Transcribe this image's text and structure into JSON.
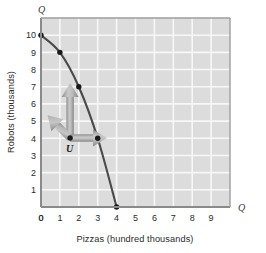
{
  "chart_data": {
    "type": "line",
    "title": "",
    "xlabel": "Pizzas (hundred thousands)",
    "ylabel": "Robots (thousands)",
    "x_axis_symbol": "Q",
    "y_axis_symbol": "Q",
    "xlim": [
      0,
      10
    ],
    "ylim": [
      0,
      11
    ],
    "xticks": [
      0,
      1,
      2,
      3,
      4,
      5,
      6,
      7,
      8,
      9
    ],
    "yticks": [
      0,
      1,
      2,
      3,
      4,
      5,
      6,
      7,
      8,
      9,
      10
    ],
    "xtick_labels": [
      "0",
      "1",
      "2",
      "3",
      "4",
      "5",
      "6",
      "7",
      "8",
      "9"
    ],
    "ytick_labels": [
      "0",
      "1",
      "2",
      "3",
      "4",
      "5",
      "6",
      "7",
      "8",
      "9",
      "10"
    ],
    "grid": true,
    "legend": "none",
    "series": [
      {
        "name": "Production possibilities frontier",
        "type": "line",
        "color": "#4a4a4a",
        "x": [
          0,
          1,
          2,
          3,
          4
        ],
        "values": [
          10,
          9,
          7,
          4,
          0
        ],
        "marked_points": [
          {
            "x": 0,
            "y": 10
          },
          {
            "x": 1,
            "y": 9
          },
          {
            "x": 2,
            "y": 7
          },
          {
            "x": 3,
            "y": 4
          },
          {
            "x": 4,
            "y": 0
          }
        ]
      }
    ],
    "annotations": [
      {
        "name": "point-u",
        "label": "U",
        "x": 1.5,
        "y": 4,
        "description": "Inefficient production point inside the frontier"
      },
      {
        "name": "arrow-up",
        "label": "",
        "from": {
          "x": 1.5,
          "y": 4
        },
        "to": {
          "x": 1.5,
          "y": 7
        },
        "direction": "up",
        "color": "#9b9b9b"
      },
      {
        "name": "arrow-diagonal",
        "label": "",
        "from": {
          "x": 1.5,
          "y": 4
        },
        "to": {
          "x": 2.3,
          "y": 5.4
        },
        "direction": "up-right",
        "color": "#9b9b9b"
      },
      {
        "name": "arrow-right",
        "label": "",
        "from": {
          "x": 1.5,
          "y": 4
        },
        "to": {
          "x": 3,
          "y": 4
        },
        "direction": "right",
        "color": "#9b9b9b"
      }
    ],
    "colors": {
      "plot_background": "#dcdcdc",
      "gridline": "#f7f7f7",
      "axis": "#8a8a8a",
      "curve": "#4a4a4a",
      "point": "#1a1a1a",
      "arrow": "#9b9b9b",
      "text": "#2b2b2b"
    }
  }
}
